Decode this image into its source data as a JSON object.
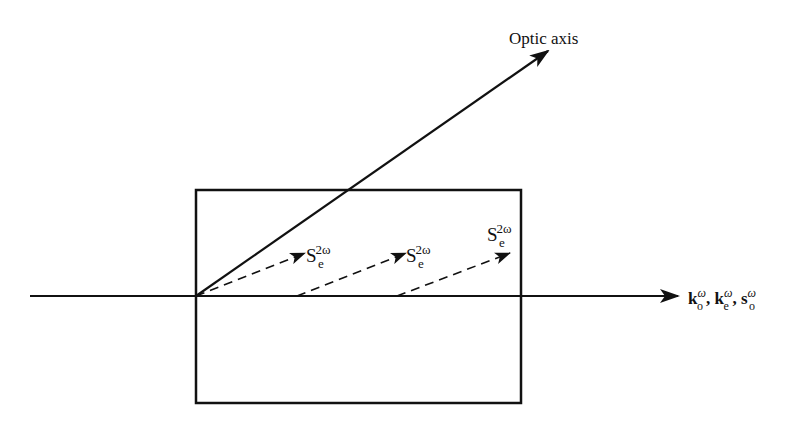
{
  "diagram": {
    "title": "",
    "optic_axis": {
      "label": "Optic axis",
      "from": [
        196,
        296
      ],
      "to": [
        548,
        51
      ]
    },
    "beam_axis": {
      "from": [
        30,
        296
      ],
      "to": [
        678,
        296
      ],
      "label_parts": [
        {
          "base": "k",
          "sup": "ω",
          "sub": "o",
          "sep": ","
        },
        {
          "base": "k",
          "sup": "ω",
          "sub": "e",
          "sep": ","
        },
        {
          "base": "s",
          "sup": "ω",
          "sub": "o",
          "sep": ""
        }
      ]
    },
    "crystal": {
      "x": 196,
      "y": 190,
      "width": 325,
      "height": 213
    },
    "poynting_arrows": [
      {
        "from": [
          196,
          296
        ],
        "to": [
          305,
          253
        ],
        "label": {
          "base": "S",
          "sup": "2ω",
          "sub": "e"
        }
      },
      {
        "from": [
          297,
          296
        ],
        "to": [
          406,
          253
        ],
        "label": {
          "base": "S",
          "sup": "2ω",
          "sub": "e"
        }
      },
      {
        "from": [
          397,
          296
        ],
        "to": [
          510,
          253
        ],
        "label": {
          "base": "S",
          "sup": "2ω",
          "sub": "e"
        }
      }
    ],
    "colors": {
      "stroke": "#111111",
      "background": "#ffffff"
    }
  }
}
